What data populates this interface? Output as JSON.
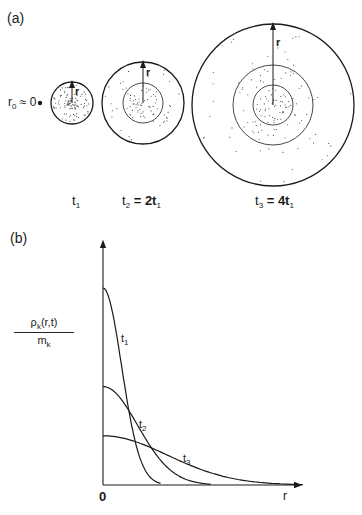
{
  "panel_a": {
    "label": "(a)",
    "origin_label": {
      "r": "r",
      "sub": "0",
      "rest": " ≈ 0"
    },
    "radius_label": "r",
    "times": [
      {
        "t": "t",
        "sub": "1",
        "rest": ""
      },
      {
        "t": "t",
        "sub": "2",
        "rest": " = 2t",
        "sub2": "1"
      },
      {
        "t": "t",
        "sub": "3",
        "rest": " = 4t",
        "sub2": "1"
      }
    ]
  },
  "panel_b": {
    "label": "(b)",
    "y_label": {
      "num": "ρ",
      "num_sub": "k",
      "num_rest": "(r,t)",
      "den": "m",
      "den_sub": "k"
    },
    "x_label": "r",
    "origin": "0",
    "curves": [
      {
        "t": "t",
        "sub": "1"
      },
      {
        "t": "t",
        "sub": "2"
      },
      {
        "t": "t",
        "sub": "3"
      }
    ]
  },
  "chart_data": {
    "type": "line",
    "title": "",
    "xlabel": "r",
    "ylabel": "ρk(r,t)/mk",
    "series": [
      {
        "name": "t1",
        "peak": 1.0,
        "zero_at_r": 0.23
      },
      {
        "name": "t2",
        "peak": 0.5,
        "zero_at_r": 0.43
      },
      {
        "name": "t3",
        "peak": 0.25,
        "zero_at_r": 0.8
      }
    ]
  }
}
